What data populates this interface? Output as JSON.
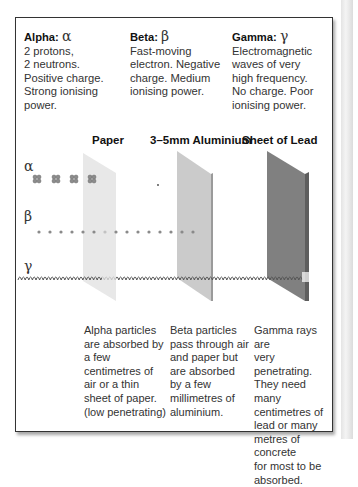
{
  "particles": [
    {
      "name": "Alpha:",
      "symbol": "α",
      "description": [
        "2 protons,",
        "2 neutrons.",
        "Positive charge.",
        "Strong ionising",
        "power."
      ]
    },
    {
      "name": "Beta:",
      "symbol": "β",
      "description": [
        "Fast-moving",
        "electron. Negative",
        "charge. Medium",
        "ionising power."
      ]
    },
    {
      "name": "Gamma:",
      "symbol": "γ",
      "description": [
        "Electromagnetic",
        "waves of very",
        "high frequency.",
        "No charge. Poor",
        "ionising power."
      ]
    }
  ],
  "barriers": [
    {
      "label": "Paper",
      "color": "#e6e6e6"
    },
    {
      "label": "3–5mm Aluminium",
      "color": "#c8c8c8"
    },
    {
      "label": "Sheet of Lead",
      "color": "#7a7a7a"
    }
  ],
  "rows": {
    "alpha_symbol": "α",
    "beta_symbol": "β",
    "gamma_symbol": "γ"
  },
  "notes": [
    [
      "Alpha particles",
      "are absorbed by",
      "a few",
      "centimetres of",
      "air or a thin",
      "sheet of paper.",
      "(low penetrating)"
    ],
    [
      "Beta particles",
      "pass through air",
      "and paper but",
      "are absorbed",
      "by a few",
      "millimetres of",
      "aluminium."
    ],
    [
      "Gamma rays are",
      "very penetrating.",
      "They need many",
      "centimetres of",
      "lead or many",
      "metres of concrete",
      "for most to be",
      "absorbed."
    ]
  ]
}
